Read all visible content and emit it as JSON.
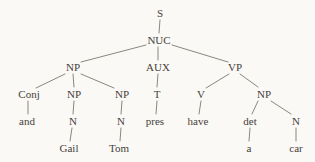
{
  "diagram_title": "Syntax tree for sentence with conjoined subject (Gail and Tom have a car)",
  "colors": {
    "background": "#faf9f5",
    "text": "#45413a",
    "line": "#7d7971"
  },
  "tree": {
    "nodes": {
      "s": "S",
      "nuc": "NUC",
      "np_subject": "NP",
      "aux": "AUX",
      "vp": "VP",
      "conj": "Conj",
      "np_first": "NP",
      "np_second": "NP",
      "t": "T",
      "v": "V",
      "np_object": "NP",
      "and": "and",
      "n_first": "N",
      "n_second": "N",
      "pres": "pres",
      "have": "have",
      "det": "det",
      "n_object": "N",
      "gail": "Gail",
      "tom": "Tom",
      "a": "a",
      "car": "car"
    },
    "structure": {
      "S": [
        "NUC"
      ],
      "NUC": [
        "NP",
        "AUX",
        "VP"
      ],
      "NP(subject)": [
        "Conj",
        "NP",
        "NP"
      ],
      "Conj": [
        "and"
      ],
      "NP(first)": [
        "N:Gail"
      ],
      "NP(second)": [
        "N:Tom"
      ],
      "AUX": [
        "T:pres"
      ],
      "VP": [
        "V:have",
        "NP"
      ],
      "NP(object)": [
        "det:a",
        "N:car"
      ]
    }
  }
}
